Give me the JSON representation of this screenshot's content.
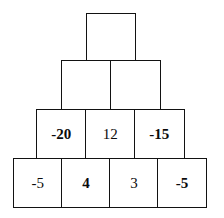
{
  "figure": {
    "kind": "number-pyramid",
    "background_color": "#ffffff",
    "border_color": "#121212",
    "text_color": "#0b0b0b",
    "rows": [
      {
        "index": 1,
        "cells": [
          {
            "value": "",
            "weight": "regular"
          }
        ]
      },
      {
        "index": 2,
        "cells": [
          {
            "value": "",
            "weight": "regular"
          },
          {
            "value": "",
            "weight": "regular"
          }
        ]
      },
      {
        "index": 3,
        "cells": [
          {
            "value": "-20",
            "weight": "bold"
          },
          {
            "value": "12",
            "weight": "regular"
          },
          {
            "value": "-15",
            "weight": "bold"
          }
        ]
      },
      {
        "index": 4,
        "cells": [
          {
            "value": "-5",
            "weight": "regular"
          },
          {
            "value": "4",
            "weight": "bold"
          },
          {
            "value": "3",
            "weight": "regular"
          },
          {
            "value": "-5",
            "weight": "bold"
          }
        ]
      }
    ]
  }
}
